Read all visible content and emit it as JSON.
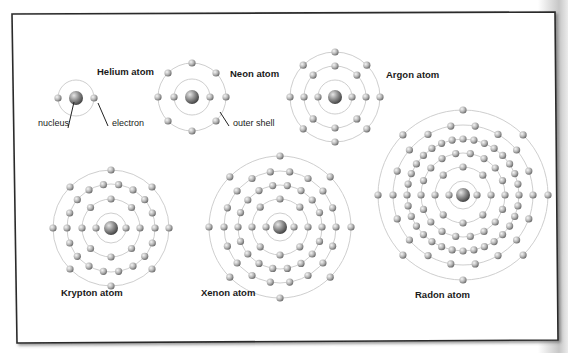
{
  "figure": {
    "colors": {
      "frame_border": "#2a2a2a",
      "panel_background": "#ffffff",
      "orbit_line": "#c8c8c8",
      "electron_light": "#f2f2f2",
      "electron_dark": "#6e6e6e",
      "nucleus_light": "#e0e0e0",
      "nucleus_dark": "#4a4a4a",
      "text": "#1a1a1a"
    },
    "annotations": {
      "nucleus": "nucleus",
      "electron": "electron",
      "outer_shell": "outer shell"
    },
    "atoms": [
      {
        "name": "Helium atom",
        "cx": 76,
        "cy": 98,
        "radii": [
          18
        ],
        "electrons": [
          2
        ],
        "label_x": 97,
        "label_y": 66
      },
      {
        "name": "Neon atom",
        "cx": 192,
        "cy": 97,
        "radii": [
          18,
          34
        ],
        "electrons": [
          2,
          8
        ],
        "label_x": 230,
        "label_y": 68
      },
      {
        "name": "Argon atom",
        "cx": 335,
        "cy": 97,
        "radii": [
          17,
          31,
          45
        ],
        "electrons": [
          2,
          8,
          8
        ],
        "label_x": 386,
        "label_y": 69
      },
      {
        "name": "Krypton atom",
        "cx": 111,
        "cy": 228,
        "radii": [
          15,
          29,
          44,
          58
        ],
        "electrons": [
          2,
          8,
          18,
          8
        ],
        "label_x": 61,
        "label_y": 287
      },
      {
        "name": "Xenon atom",
        "cx": 280,
        "cy": 227,
        "radii": [
          14,
          28,
          42,
          56,
          71
        ],
        "electrons": [
          2,
          8,
          18,
          18,
          8
        ],
        "label_x": 201,
        "label_y": 287
      },
      {
        "name": "Radon atom",
        "cx": 463,
        "cy": 195,
        "radii": [
          14,
          28,
          42,
          56,
          70,
          85
        ],
        "electrons": [
          2,
          8,
          18,
          32,
          18,
          8
        ],
        "label_x": 415,
        "label_y": 289
      }
    ]
  }
}
